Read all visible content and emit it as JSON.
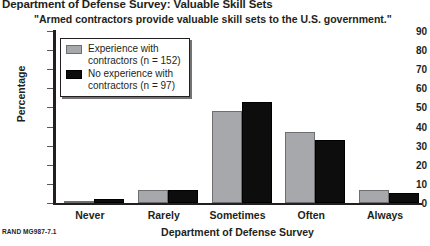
{
  "chart_data": {
    "type": "bar",
    "title": "Department of Defense Survey: Valuable Skill Sets",
    "subtitle": "\"Armed contractors provide valuable skill sets to the U.S. government.\"",
    "xlabel": "Department of Defense Survey",
    "ylabel": "Percentage",
    "categories": [
      "Never",
      "Rarely",
      "Sometimes",
      "Often",
      "Always"
    ],
    "series": [
      {
        "name": "Experience with contractors (n = 152)",
        "color": "#a6a8ab",
        "values": [
          1,
          7,
          48,
          37,
          7
        ]
      },
      {
        "name": "No experience with contractors (n = 97)",
        "color": "#0d0d0d",
        "values": [
          2,
          7,
          53,
          33,
          5
        ]
      }
    ],
    "ylim": [
      0,
      90
    ],
    "yticks": [
      0,
      10,
      20,
      30,
      40,
      50,
      60,
      70,
      80,
      90
    ],
    "ytick_labels": [
      "0",
      "10",
      "20",
      "30",
      "40",
      "50",
      "60",
      "70",
      "80",
      "90"
    ],
    "grid": false,
    "legend_position": "upper-left"
  },
  "legend": {
    "entries": [
      {
        "label": "Experience with\ncontractors (n = 152)"
      },
      {
        "label": "No experience with\ncontractors (n = 97)"
      }
    ]
  },
  "footer": {
    "source_note": "RAND MG987-7.1"
  }
}
